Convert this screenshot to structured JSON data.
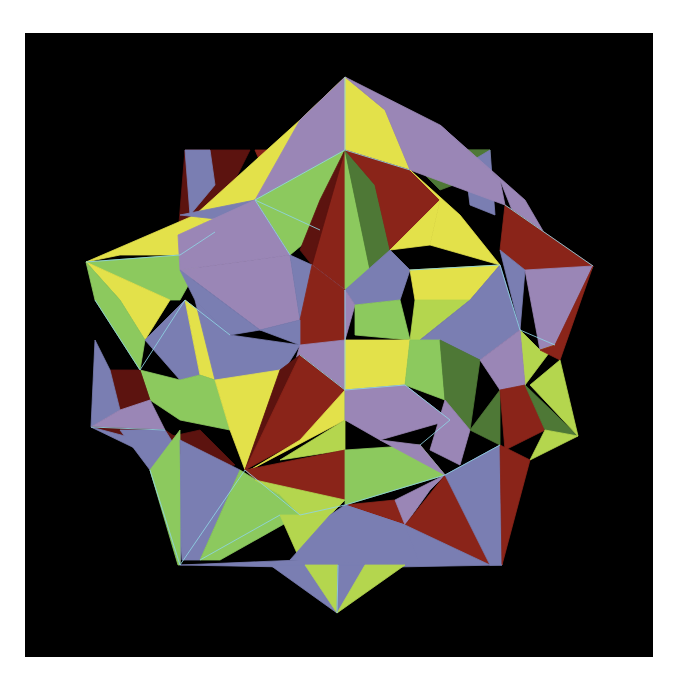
{
  "frame": {
    "x": 25,
    "y": 33,
    "width": 628,
    "height": 624,
    "background": "#000000"
  },
  "palette": {
    "yellow": "#e3e14a",
    "lime": "#b4d64e",
    "green": "#8cc95e",
    "darkgreen": "#4e7836",
    "lavender": "#9a86b6",
    "slate": "#7a7eb2",
    "red": "#8a2419",
    "maroon": "#5c130f",
    "edge": "#8fd4e4"
  },
  "faces": [
    {
      "c": "maroon",
      "p": "185,150 250,150 225,200 178,235"
    },
    {
      "c": "slate",
      "p": "185,150 210,150 215,185 190,215"
    },
    {
      "c": "red",
      "p": "255,150 345,150 330,180 270,185"
    },
    {
      "c": "red",
      "p": "300,150 345,150 345,170"
    },
    {
      "c": "darkgreen",
      "p": "400,150 490,150 480,175 440,190"
    },
    {
      "c": "darkgreen",
      "p": "455,150 490,150 490,190 470,185"
    },
    {
      "c": "slate",
      "p": "465,165 490,150 495,215 470,205"
    },
    {
      "c": "yellow",
      "p": "345,77 300,120 195,215 215,232 255,200 345,150"
    },
    {
      "c": "lavender",
      "p": "345,77 345,150 255,200 300,120"
    },
    {
      "c": "yellow",
      "p": "345,77 345,150 410,170 385,110"
    },
    {
      "c": "lavender",
      "p": "345,77 385,110 410,170 505,205 500,180 440,125"
    },
    {
      "c": "lavender",
      "p": "440,125 500,180 520,230 560,260 525,200"
    },
    {
      "c": "yellow",
      "p": "86,262 195,215 215,232 180,255 120,255"
    },
    {
      "c": "green",
      "p": "255,200 345,150 320,230 290,255"
    },
    {
      "c": "red",
      "p": "345,150 320,230 312,265 345,290"
    },
    {
      "c": "maroon",
      "p": "345,150 312,265 300,250 320,200"
    },
    {
      "c": "green",
      "p": "345,150 345,290 370,270"
    },
    {
      "c": "darkgreen",
      "p": "345,150 370,270 390,250 375,185"
    },
    {
      "c": "red",
      "p": "345,150 410,170 440,200 390,250 375,185"
    },
    {
      "c": "yellow",
      "p": "410,170 440,200 430,245 500,265 460,215"
    },
    {
      "c": "yellow",
      "p": "440,200 390,250 430,245"
    },
    {
      "c": "red",
      "p": "505,205 593,266 525,270 500,250"
    },
    {
      "c": "slate",
      "p": "500,250 525,270 520,330"
    },
    {
      "c": "lavender",
      "p": "525,270 593,266 555,345 540,350"
    },
    {
      "c": "green",
      "p": "86,262 180,255 215,232 225,220 180,300 170,300"
    },
    {
      "c": "slate",
      "p": "180,215 255,200 225,220"
    },
    {
      "c": "lavender",
      "p": "178,235 255,200 290,255 180,270"
    },
    {
      "c": "lavender",
      "p": "180,270 290,255 300,320 260,330"
    },
    {
      "c": "slate",
      "p": "180,270 260,330 230,335 195,300"
    },
    {
      "c": "slate",
      "p": "290,255 312,265 345,290 335,320 300,320"
    },
    {
      "c": "red",
      "p": "312,265 345,290 345,340 300,345 300,320"
    },
    {
      "c": "slate",
      "p": "345,290 390,250 410,270 400,300 355,305"
    },
    {
      "c": "lavender",
      "p": "345,290 355,305 345,340"
    },
    {
      "c": "green",
      "p": "355,305 400,300 410,340 355,335"
    },
    {
      "c": "yellow",
      "p": "410,270 500,265 470,300 415,300"
    },
    {
      "c": "lime",
      "p": "415,300 470,300 420,340 410,340"
    },
    {
      "c": "slate",
      "p": "470,300 500,265 520,330 480,360 440,340 420,340"
    },
    {
      "c": "lime",
      "p": "520,330 540,350 555,345 525,385"
    },
    {
      "c": "red",
      "p": "540,350 555,345 593,266 560,360"
    },
    {
      "c": "yellow",
      "p": "86,262 170,300 145,340 120,300"
    },
    {
      "c": "green",
      "p": "86,262 120,300 145,340 140,370 95,300"
    },
    {
      "c": "slate",
      "p": "145,340 185,300 200,375 180,380"
    },
    {
      "c": "yellow",
      "p": "185,300 230,335 215,380 200,375"
    },
    {
      "c": "slate",
      "p": "195,300 230,335 300,345 275,385 215,380"
    },
    {
      "c": "lavender",
      "p": "300,345 345,340 345,390 290,380"
    },
    {
      "c": "slate",
      "p": "260,330 300,320 300,345"
    },
    {
      "c": "green",
      "p": "140,370 180,380 200,375 215,380 230,430 180,420 150,400"
    },
    {
      "c": "maroon",
      "p": "110,370 140,370 150,400 120,410"
    },
    {
      "c": "slate",
      "p": "95,340 110,370 120,410 91,427"
    },
    {
      "c": "lavender",
      "p": "91,427 120,410 150,400 165,430"
    },
    {
      "c": "maroon",
      "p": "91,427 165,430 180,440 140,440"
    },
    {
      "c": "slate",
      "p": "91,427 140,440 180,470"
    },
    {
      "c": "yellow",
      "p": "215,380 280,370 245,470 230,430"
    },
    {
      "c": "maroon",
      "p": "280,370 300,355 290,395 245,470"
    },
    {
      "c": "red",
      "p": "300,355 345,390 300,440 245,470"
    },
    {
      "c": "yellow",
      "p": "345,390 300,440 250,470 345,420"
    },
    {
      "c": "lime",
      "p": "345,390 345,420 280,460 345,450"
    },
    {
      "c": "yellow",
      "p": "345,340 410,340 405,385 345,390"
    },
    {
      "c": "lime",
      "p": "345,390 405,385 380,420 345,420"
    },
    {
      "c": "lavender",
      "p": "345,390 405,385 450,420 380,440 345,420"
    },
    {
      "c": "green",
      "p": "410,340 440,340 445,400 405,385"
    },
    {
      "c": "darkgreen",
      "p": "440,340 480,360 470,430 445,400"
    },
    {
      "c": "lavender",
      "p": "480,360 520,330 525,385 500,390"
    },
    {
      "c": "lavender",
      "p": "445,400 470,430 460,465 430,450"
    },
    {
      "c": "darkgreen",
      "p": "470,430 500,390 500,445"
    },
    {
      "c": "red",
      "p": "500,390 525,385 545,430 505,450"
    },
    {
      "c": "darkgreen",
      "p": "525,385 578,436 545,430"
    },
    {
      "c": "lime",
      "p": "545,430 578,436 530,460"
    },
    {
      "c": "lime",
      "p": "530,385 560,360 578,436"
    },
    {
      "c": "maroon",
      "p": "155,440 200,430 235,465 190,470"
    },
    {
      "c": "slate",
      "p": "120,430 165,430 190,470 180,565 150,470"
    },
    {
      "c": "green",
      "p": "150,470 180,430 180,565 178,565"
    },
    {
      "c": "slate",
      "p": "180,440 240,470 200,560 182,560"
    },
    {
      "c": "red",
      "p": "245,470 345,450 345,500 255,480"
    },
    {
      "c": "green",
      "p": "200,560 240,470 280,495 300,515 220,560"
    },
    {
      "c": "lime",
      "p": "255,480 345,500 330,515 300,515 280,495"
    },
    {
      "c": "lime",
      "p": "280,515 330,515 300,560"
    },
    {
      "c": "green",
      "p": "345,450 345,505 445,475 420,445"
    },
    {
      "c": "lavender",
      "p": "380,440 445,475 420,445"
    },
    {
      "c": "red",
      "p": "345,505 395,500 405,525"
    },
    {
      "c": "lavender",
      "p": "395,500 445,475 430,490 405,525"
    },
    {
      "c": "red",
      "p": "405,525 445,475 490,565"
    },
    {
      "c": "slate",
      "p": "445,475 500,445 502,565 490,565"
    },
    {
      "c": "red",
      "p": "500,445 530,460 502,565"
    },
    {
      "c": "slate",
      "p": "180,565 300,560 345,505 405,525 490,565 502,565 340,568"
    },
    {
      "c": "slate",
      "p": "290,560 330,515 345,505 405,525 420,565"
    },
    {
      "c": "slate",
      "p": "270,565 337,613 312,565"
    },
    {
      "c": "lime",
      "p": "305,565 337,613 338,565"
    },
    {
      "c": "slate",
      "p": "338,565 337,613 370,565"
    },
    {
      "c": "lime",
      "p": "365,565 337,613 405,565"
    }
  ],
  "edges": [
    "345,77 345,150",
    "255,200 320,230",
    "345,150 255,200",
    "86,262 180,255",
    "180,255 215,232",
    "290,255 255,200",
    "345,150 410,170",
    "505,205 593,266",
    "500,265 520,330",
    "520,330 555,345",
    "410,270 500,265",
    "345,290 345,390",
    "345,390 300,355",
    "345,390 405,385",
    "405,385 450,420",
    "420,445 450,420",
    "445,475 500,445",
    "345,505 445,475",
    "150,470 180,565",
    "180,565 245,470",
    "245,470 300,515",
    "300,515 345,505",
    "200,560 280,515",
    "140,370 185,300",
    "185,300 230,335",
    "91,427 165,430",
    "95,300 140,370",
    "337,613 338,565"
  ]
}
